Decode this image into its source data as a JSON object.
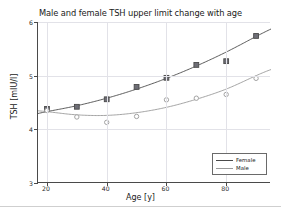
{
  "chart_data": {
    "type": "scatter",
    "title": "Male and female TSH upper limit change with age",
    "xlabel": "Age [y]",
    "ylabel": "TSH [mIU/l]",
    "xlim": [
      17,
      95
    ],
    "ylim": [
      3,
      6
    ],
    "xticks": [
      20,
      40,
      60,
      80
    ],
    "yticks": [
      3,
      4,
      5,
      6
    ],
    "grid": true,
    "legend_position": "lower right",
    "x": [
      20,
      30,
      40,
      50,
      60,
      70,
      80,
      90
    ],
    "series": [
      {
        "name": "Female",
        "color": "#4a4a4a",
        "marker": "square",
        "values": [
          4.38,
          4.42,
          4.56,
          4.79,
          4.96,
          5.2,
          5.27,
          5.74
        ],
        "fit": [
          4.33,
          4.44,
          4.58,
          4.75,
          4.95,
          5.18,
          5.44,
          5.73
        ]
      },
      {
        "name": "Male",
        "color": "#9a9a9a",
        "marker": "circle",
        "values": [
          4.35,
          4.23,
          4.13,
          4.24,
          4.55,
          4.58,
          4.65,
          4.95
        ],
        "fit": [
          4.33,
          4.27,
          4.26,
          4.31,
          4.41,
          4.56,
          4.75,
          5.0
        ]
      }
    ]
  },
  "legend": {
    "entries": [
      {
        "label": "Female"
      },
      {
        "label": "Male"
      }
    ]
  }
}
